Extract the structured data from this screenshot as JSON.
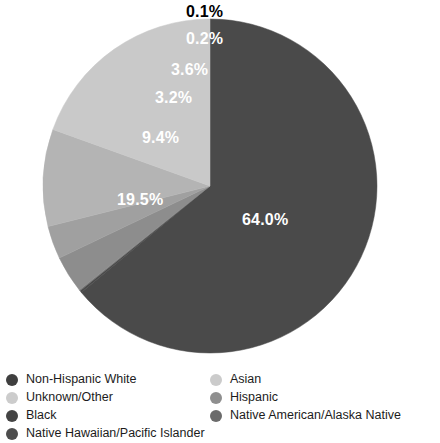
{
  "chart_data": {
    "type": "pie",
    "title": "",
    "subtitle": "",
    "xlabel": "",
    "ylabel": "",
    "grid": false,
    "legend_position": "bottom",
    "start_angle_deg": 90,
    "direction": "counterclockwise",
    "categories": [
      "Non-Hispanic White",
      "Hispanic",
      "Black",
      "Asian",
      "Unknown/Other",
      "Native American/Alaska Native",
      "Native Hawaiian/Pacific Islander"
    ],
    "values": [
      64.0,
      19.5,
      9.4,
      3.2,
      3.6,
      0.2,
      0.1
    ],
    "labels": [
      "64.0%",
      "19.5%",
      "9.4%",
      "3.2%",
      "3.6%",
      "0.2%",
      "0.1%"
    ],
    "colors": [
      "#4a4a4a",
      "#c9c9c9",
      "#b4b4b4",
      "#a0a0a0",
      "#8d8d8d",
      "#5e5e5e",
      "#6f6f6f"
    ],
    "units": "percent"
  },
  "pie": {
    "geometry": {
      "cx": 210,
      "cy": 186,
      "r": 167
    },
    "slices": [
      {
        "name": "Non-Hispanic White",
        "value": 64.0,
        "label": "64.0%",
        "color": "#4a4a4a"
      },
      {
        "name": "Native American/Alaska Native",
        "value": 0.2,
        "label": "0.2%",
        "color": "#4a4a4a"
      },
      {
        "name": "Native Hawaiian/Pacific Islander",
        "value": 0.1,
        "label": "0.1%",
        "color": "#6f6f6f"
      },
      {
        "name": "Unknown/Other",
        "value": 3.6,
        "label": "3.6%",
        "color": "#8d8d8d"
      },
      {
        "name": "Asian",
        "value": 3.2,
        "label": "3.2%",
        "color": "#a0a0a0"
      },
      {
        "name": "Black",
        "value": 9.4,
        "label": "9.4%",
        "color": "#b4b4b4"
      },
      {
        "name": "Hispanic",
        "value": 19.5,
        "label": "19.5%",
        "color": "#c9c9c9"
      }
    ],
    "label_positions": [
      {
        "text": "0.1%",
        "x": 186,
        "y": 4,
        "placement": "outside"
      },
      {
        "text": "0.2%",
        "x": 186,
        "y": 31,
        "placement": "inside"
      },
      {
        "text": "3.6%",
        "x": 171,
        "y": 62,
        "placement": "inside"
      },
      {
        "text": "3.2%",
        "x": 155,
        "y": 90,
        "placement": "inside"
      },
      {
        "text": "9.4%",
        "x": 142,
        "y": 130,
        "placement": "inside"
      },
      {
        "text": "19.5%",
        "x": 117,
        "y": 192,
        "placement": "inside"
      },
      {
        "text": "64.0%",
        "x": 242,
        "y": 212,
        "placement": "inside"
      }
    ]
  },
  "legend": {
    "columns": [
      {
        "items": [
          {
            "label": "Non-Hispanic White",
            "color": "#3f3f3f",
            "marker": "circle-marker"
          },
          {
            "label": "Unknown/Other",
            "color": "#cccccc",
            "marker": "circle-marker"
          },
          {
            "label": "Black",
            "color": "#444444",
            "marker": "circle-marker"
          },
          {
            "label": "Native Hawaiian/Pacific Islander",
            "color": "#4d4d4d",
            "marker": "circle-marker"
          }
        ]
      },
      {
        "items": [
          {
            "label": "Asian",
            "color": "#cbcbcb",
            "marker": "circle-marker"
          },
          {
            "label": "Hispanic",
            "color": "#8f8f8f",
            "marker": "circle-marker"
          },
          {
            "label": "Native American/Alaska Native",
            "color": "#6b6b6b",
            "marker": "circle-marker"
          }
        ]
      }
    ]
  }
}
